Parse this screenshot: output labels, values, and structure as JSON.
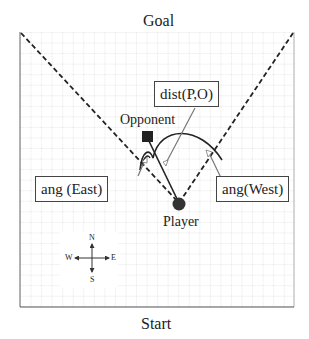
{
  "diagram": {
    "top_label": "Goal",
    "bottom_label": "Start",
    "player_label": "Player",
    "opponent_label": "Opponent",
    "boxes": {
      "dist": "dist(P,O)",
      "ang_east": "ang (East)",
      "ang_west": "ang(West)"
    },
    "compass": {
      "north": "N",
      "south": "S",
      "east": "E",
      "west": "W"
    },
    "colors": {
      "grid_line": "#b8b8b8",
      "border": "#555555",
      "marker": "#333333",
      "callout": "#666666"
    }
  }
}
